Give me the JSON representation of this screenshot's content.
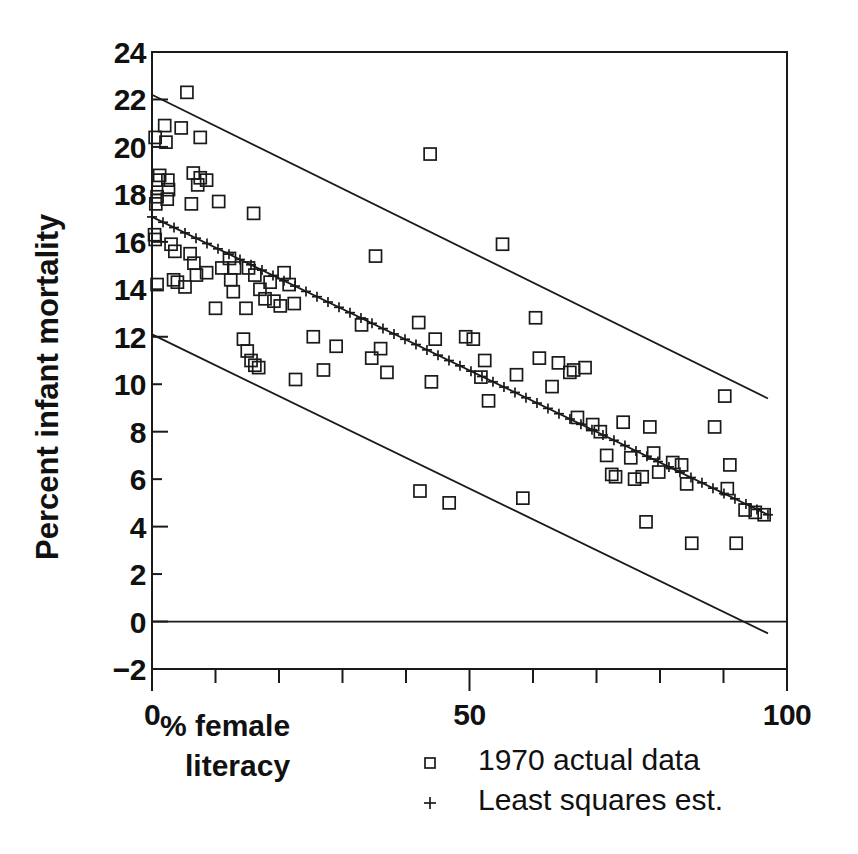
{
  "chart_data": {
    "type": "scatter",
    "title": "",
    "xlabel": "% female literacy",
    "xlabel_lines": [
      "% female",
      "literacy"
    ],
    "ylabel": "Percent infant mortality",
    "xlim": [
      0,
      100
    ],
    "ylim": [
      -2,
      24
    ],
    "grid": false,
    "x_ticks_major": [
      0,
      50,
      100
    ],
    "x_ticks_major_labels": [
      "0",
      "50",
      "100"
    ],
    "x_ticks_minor": [
      10,
      20,
      30,
      40,
      60,
      70,
      80,
      90
    ],
    "y_ticks": [
      -2,
      0,
      2,
      4,
      6,
      8,
      10,
      12,
      14,
      16,
      18,
      20,
      22,
      24
    ],
    "y_tick_labels": [
      "−2",
      "0",
      "2",
      "4",
      "6",
      "8",
      "10",
      "12",
      "14",
      "16",
      "18",
      "20",
      "22",
      "24"
    ],
    "legend_position": "below-right",
    "series": [
      {
        "name": "1970 actual data",
        "type": "scatter",
        "marker": "open-square",
        "points": [
          [
            0.5,
            20.4
          ],
          [
            1.2,
            18.8
          ],
          [
            1.0,
            18.6
          ],
          [
            0.8,
            17.9
          ],
          [
            0.6,
            17.6
          ],
          [
            0.4,
            16.3
          ],
          [
            0.5,
            16.1
          ],
          [
            0.8,
            14.2
          ],
          [
            2.0,
            20.9
          ],
          [
            2.2,
            20.2
          ],
          [
            2.5,
            18.6
          ],
          [
            2.6,
            18.2
          ],
          [
            2.4,
            17.8
          ],
          [
            5.5,
            22.3
          ],
          [
            4.6,
            20.8
          ],
          [
            7.6,
            20.4
          ],
          [
            6.5,
            18.9
          ],
          [
            7.6,
            18.7
          ],
          [
            7.2,
            18.4
          ],
          [
            8.6,
            18.6
          ],
          [
            3.0,
            15.9
          ],
          [
            3.6,
            15.6
          ],
          [
            3.4,
            14.4
          ],
          [
            4.0,
            14.3
          ],
          [
            6.2,
            17.6
          ],
          [
            6.0,
            15.5
          ],
          [
            6.6,
            15.1
          ],
          [
            7.0,
            14.6
          ],
          [
            8.6,
            14.7
          ],
          [
            5.2,
            14.1
          ],
          [
            10.5,
            17.7
          ],
          [
            12.2,
            15.3
          ],
          [
            11.0,
            14.9
          ],
          [
            12.4,
            14.4
          ],
          [
            13.0,
            14.9
          ],
          [
            12.8,
            13.9
          ],
          [
            14.8,
            13.2
          ],
          [
            10.0,
            13.2
          ],
          [
            16.0,
            17.2
          ],
          [
            15.2,
            14.9
          ],
          [
            16.2,
            14.6
          ],
          [
            17.0,
            14.0
          ],
          [
            18.6,
            14.3
          ],
          [
            17.8,
            13.6
          ],
          [
            19.2,
            13.5
          ],
          [
            20.8,
            14.7
          ],
          [
            21.6,
            14.2
          ],
          [
            22.4,
            13.4
          ],
          [
            20.2,
            13.3
          ],
          [
            14.4,
            11.9
          ],
          [
            15.0,
            11.4
          ],
          [
            15.6,
            11.0
          ],
          [
            16.2,
            10.8
          ],
          [
            16.8,
            10.7
          ],
          [
            22.6,
            10.2
          ],
          [
            25.4,
            12.0
          ],
          [
            29.0,
            11.6
          ],
          [
            27.0,
            10.6
          ],
          [
            35.2,
            15.4
          ],
          [
            33.0,
            12.5
          ],
          [
            36.0,
            11.5
          ],
          [
            34.6,
            11.1
          ],
          [
            37.0,
            10.5
          ],
          [
            42.0,
            12.6
          ],
          [
            43.8,
            19.7
          ],
          [
            44.6,
            11.9
          ],
          [
            44.0,
            10.1
          ],
          [
            42.2,
            5.5
          ],
          [
            46.8,
            5.0
          ],
          [
            49.4,
            12.0
          ],
          [
            50.6,
            11.9
          ],
          [
            52.4,
            11.0
          ],
          [
            51.8,
            10.3
          ],
          [
            53.0,
            9.3
          ],
          [
            55.2,
            15.9
          ],
          [
            58.4,
            5.2
          ],
          [
            60.4,
            12.8
          ],
          [
            61.0,
            11.1
          ],
          [
            57.4,
            10.4
          ],
          [
            64.0,
            10.9
          ],
          [
            65.8,
            10.5
          ],
          [
            63.0,
            9.9
          ],
          [
            66.4,
            10.6
          ],
          [
            68.2,
            10.7
          ],
          [
            67.0,
            8.6
          ],
          [
            69.4,
            8.3
          ],
          [
            70.6,
            8.0
          ],
          [
            71.6,
            7.0
          ],
          [
            72.4,
            6.2
          ],
          [
            73.0,
            6.1
          ],
          [
            74.2,
            8.4
          ],
          [
            75.4,
            6.9
          ],
          [
            76.0,
            6.0
          ],
          [
            77.2,
            6.1
          ],
          [
            78.4,
            8.2
          ],
          [
            79.0,
            7.1
          ],
          [
            79.8,
            6.3
          ],
          [
            77.8,
            4.2
          ],
          [
            82.0,
            6.7
          ],
          [
            83.4,
            6.6
          ],
          [
            84.2,
            5.8
          ],
          [
            85.0,
            3.3
          ],
          [
            88.6,
            8.2
          ],
          [
            90.2,
            9.5
          ],
          [
            91.0,
            6.6
          ],
          [
            90.6,
            5.6
          ],
          [
            92.0,
            3.3
          ],
          [
            93.4,
            4.7
          ],
          [
            95.0,
            4.6
          ],
          [
            96.4,
            4.5
          ]
        ]
      },
      {
        "name": "Least squares est.",
        "type": "line-with-markers",
        "marker": "plus",
        "endpoints": [
          [
            0,
            17.05
          ],
          [
            97,
            4.5
          ]
        ],
        "slope": -0.1294,
        "intercept": 17.05
      }
    ],
    "reference_lines": [
      {
        "name": "upper-confidence-band",
        "endpoints": [
          [
            0,
            22.2
          ],
          [
            97,
            9.4
          ]
        ]
      },
      {
        "name": "lower-confidence-band",
        "endpoints": [
          [
            0,
            12.1
          ],
          [
            97,
            -0.5
          ]
        ]
      },
      {
        "name": "zero-line",
        "y": 0
      }
    ],
    "legend": [
      {
        "marker": "open-square",
        "label": "1970 actual data"
      },
      {
        "marker": "plus",
        "label": "Least squares est."
      }
    ]
  }
}
